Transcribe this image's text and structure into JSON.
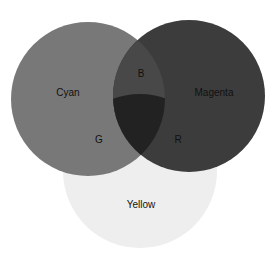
{
  "diagram": {
    "type": "venn",
    "sets": [
      {
        "name": "Cyan",
        "color": "#787878",
        "cx": 88,
        "cy": 99,
        "r": 77
      },
      {
        "name": "Magenta",
        "color": "#3c3c3c",
        "cx": 189,
        "cy": 96,
        "r": 76
      },
      {
        "name": "Yellow",
        "color": "#eeeeee",
        "cx": 140,
        "cy": 171,
        "r": 77
      }
    ],
    "intersection_colors": {
      "cyan_magenta": "#484848",
      "cyan_yellow": "#7a7a7a",
      "magenta_yellow": "#383838",
      "all": "#222222"
    },
    "labels": {
      "cyan": "Cyan",
      "magenta": "Magenta",
      "yellow": "Yellow",
      "b": "B",
      "g": "G",
      "r": "R"
    }
  }
}
